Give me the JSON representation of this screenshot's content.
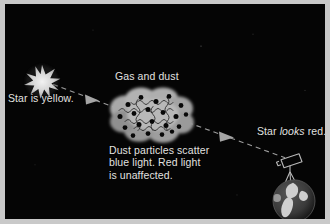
{
  "figure": {
    "background_color": "#050505",
    "frame_color": "#c9c9c9",
    "text_color": "#e2e2e0"
  },
  "labels": {
    "star_is_yellow": "Star is yellow.",
    "gas_and_dust": "Gas and dust",
    "scatter_line1": "Dust particles scatter",
    "scatter_line2": "blue light. Red light",
    "scatter_line3": "is unaffected.",
    "star_looks_pre": "Star ",
    "star_looks_em": "looks",
    "star_looks_post": " red."
  },
  "objects": {
    "star": {
      "name": "star-burst",
      "points": 10,
      "color": "#dedede",
      "cx": 37,
      "cy": 77,
      "outer_r": 15,
      "inner_r": 6
    },
    "cloud": {
      "name": "gas-and-dust-cloud",
      "color": "#9d9d9d",
      "cx": 146,
      "cy": 111,
      "rx": 40,
      "ry": 24,
      "particle_count": 20,
      "particle_color": "#080808",
      "squiggle_count": 5
    },
    "telescope": {
      "name": "telescope",
      "color": "#b5b5b5",
      "x": 285,
      "y": 152
    },
    "planet": {
      "name": "earth-globe",
      "color": "#3a3a3a",
      "land_color": "#c6c6c6",
      "cx": 289,
      "cy": 196,
      "r": 21
    }
  },
  "arrows": {
    "left_beam": {
      "name": "light-beam-star-to-cloud",
      "x1": 48,
      "y1": 80,
      "x2": 112,
      "y2": 104,
      "dash": "5 4",
      "color": "#9c9c9c"
    },
    "right_beam": {
      "name": "light-beam-cloud-to-telescope",
      "x1": 182,
      "y1": 118,
      "x2": 276,
      "y2": 152,
      "dash": "5 4",
      "color": "#9c9c9c"
    }
  }
}
